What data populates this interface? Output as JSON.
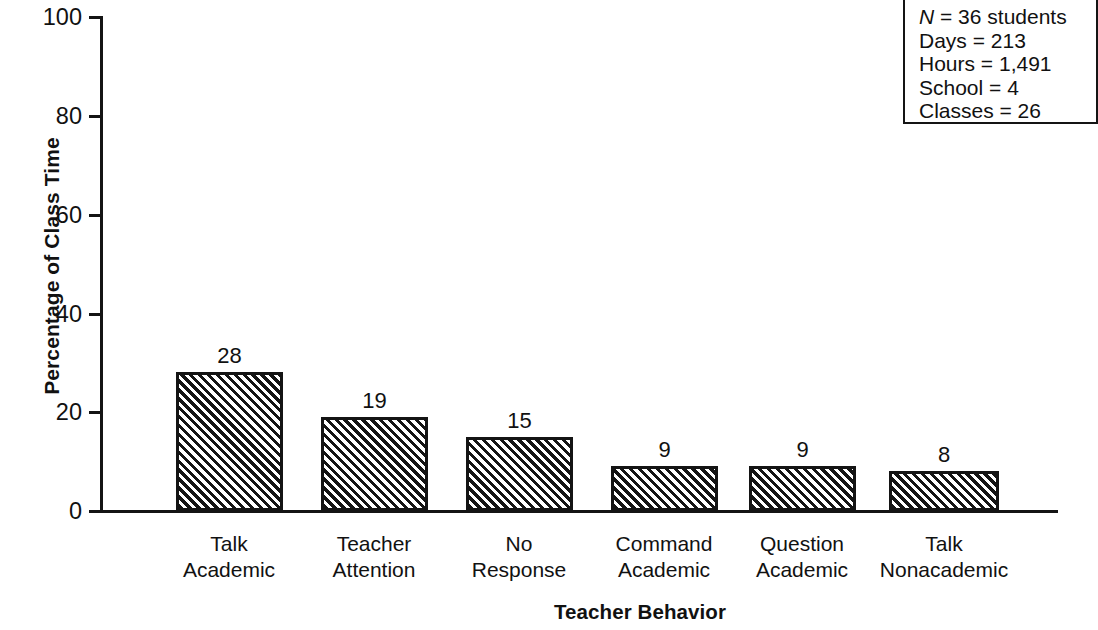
{
  "chart_data": {
    "type": "bar",
    "title": "",
    "xlabel": "Teacher Behavior",
    "ylabel": "Percentage of Class Time",
    "ylim": [
      0,
      100
    ],
    "yticks": [
      0,
      20,
      40,
      60,
      80,
      100
    ],
    "grid": false,
    "legend": "none",
    "categories": [
      "Talk\nAcademic",
      "Teacher\nAttention",
      "No\nResponse",
      "Command\nAcademic",
      "Question\nAcademic",
      "Talk\nNonacademic"
    ],
    "values": [
      28,
      19,
      15,
      9,
      9,
      8
    ],
    "data_labels": [
      "28",
      "19",
      "15",
      "9",
      "9",
      "8"
    ],
    "annotations": [
      "N = 36 students",
      "Days = 213",
      "Hours = 1,491",
      "School = 4",
      "Classes = 26"
    ]
  },
  "axes": {
    "y_title": "Percentage of Class Time",
    "x_title": "Teacher Behavior",
    "y_tick_labels": [
      "100",
      "80",
      "60",
      "40",
      "20",
      "0"
    ]
  },
  "bars": [
    {
      "label_line1": "Talk",
      "label_line2": "Academic",
      "value": 28,
      "value_label": "28"
    },
    {
      "label_line1": "Teacher",
      "label_line2": "Attention",
      "value": 19,
      "value_label": "19"
    },
    {
      "label_line1": "No",
      "label_line2": "Response",
      "value": 15,
      "value_label": "15"
    },
    {
      "label_line1": "Command",
      "label_line2": "Academic",
      "value": 9,
      "value_label": "9"
    },
    {
      "label_line1": "Question",
      "label_line2": "Academic",
      "value": 9,
      "value_label": "9"
    },
    {
      "label_line1": "Talk",
      "label_line2": "Nonacademic",
      "value": 8,
      "value_label": "8"
    }
  ],
  "info_box": {
    "n_prefix": "N",
    "n_rest": " = 36 students",
    "days": "Days = 213",
    "hours": "Hours = 1,491",
    "school": "School = 4",
    "classes": "Classes = 26"
  },
  "colors": {
    "ink": "#141414",
    "background": "#ffffff",
    "hatch": "#141414"
  }
}
